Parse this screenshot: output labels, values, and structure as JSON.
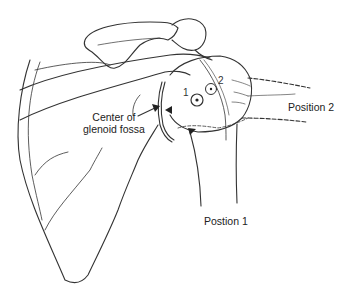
{
  "figure": {
    "line_color": "#333333",
    "background": "#ffffff"
  },
  "labels": {
    "glenoid_center_line1": "Center of",
    "glenoid_center_line2": "glenoid fossa",
    "position_2": "Position 2",
    "position_1": "Postion 1"
  },
  "markers": {
    "marker_1": "1",
    "marker_2": "2"
  },
  "icons": {
    "pointer_arrow": "arrow-icon",
    "triangle_left": "triangle-marker-icon",
    "triangle_down": "triangle-marker-icon",
    "center_dot_circle": "circled-dot-icon"
  }
}
